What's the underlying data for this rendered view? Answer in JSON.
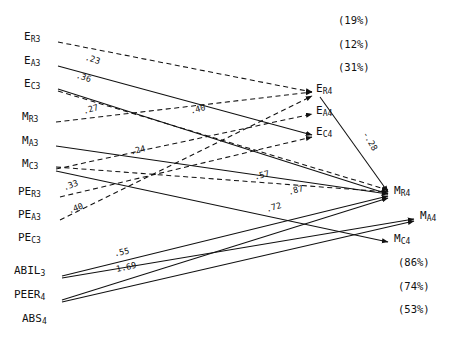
{
  "figure": {
    "type": "path-diagram",
    "background": "#ffffff",
    "ink": "#111111",
    "width": 458,
    "height": 344
  },
  "left_nodes": [
    {
      "id": "ER3",
      "base": "E",
      "sub": "R3",
      "x": 24,
      "y": 38,
      "anchor_x": 58,
      "anchor_y": 42
    },
    {
      "id": "EA3",
      "base": "E",
      "sub": "A3",
      "x": 24,
      "y": 62,
      "anchor_x": 58,
      "anchor_y": 66
    },
    {
      "id": "EC3",
      "base": "E",
      "sub": "C3",
      "x": 24,
      "y": 85,
      "anchor_x": 58,
      "anchor_y": 89
    },
    {
      "id": "MR3",
      "base": "M",
      "sub": "R3",
      "x": 22,
      "y": 118,
      "anchor_x": 56,
      "anchor_y": 122
    },
    {
      "id": "MA3",
      "base": "M",
      "sub": "A3",
      "x": 22,
      "y": 142,
      "anchor_x": 56,
      "anchor_y": 146
    },
    {
      "id": "MC3",
      "base": "M",
      "sub": "C3",
      "x": 22,
      "y": 165,
      "anchor_x": 56,
      "anchor_y": 169
    },
    {
      "id": "PER3",
      "base": "PE",
      "sub": "R3",
      "x": 18,
      "y": 193,
      "anchor_x": 60,
      "anchor_y": 197
    },
    {
      "id": "PEA3",
      "base": "PE",
      "sub": "A3",
      "x": 18,
      "y": 216,
      "anchor_x": 60,
      "anchor_y": 220
    },
    {
      "id": "PEC3",
      "base": "PE",
      "sub": "C3",
      "x": 18,
      "y": 239,
      "anchor_x": 60,
      "anchor_y": 243
    },
    {
      "id": "ABIL3",
      "base": "ABIL",
      "sub": "3",
      "x": 14,
      "y": 272,
      "anchor_x": 62,
      "anchor_y": 276
    },
    {
      "id": "PEER4",
      "base": "PEER",
      "sub": "4",
      "x": 14,
      "y": 296,
      "anchor_x": 62,
      "anchor_y": 300
    },
    {
      "id": "ABS4",
      "base": "ABS",
      "sub": "4",
      "x": 22,
      "y": 320,
      "anchor_x": 62,
      "anchor_y": 324
    }
  ],
  "right_nodes": [
    {
      "id": "ER4",
      "base": "E",
      "sub": "R4",
      "x": 316,
      "y": 90,
      "arrow_x": 314,
      "arrow_y": 94
    },
    {
      "id": "EA4",
      "base": "E",
      "sub": "A4",
      "x": 316,
      "y": 112,
      "arrow_x": 314,
      "arrow_y": 116
    },
    {
      "id": "EC4",
      "base": "E",
      "sub": "C4",
      "x": 316,
      "y": 133,
      "arrow_x": 314,
      "arrow_y": 137
    },
    {
      "id": "MR4",
      "base": "M",
      "sub": "R4",
      "x": 394,
      "y": 192,
      "arrow_x": 392,
      "arrow_y": 196
    },
    {
      "id": "MA4",
      "base": "M",
      "sub": "A4",
      "x": 420,
      "y": 217,
      "arrow_x": 418,
      "arrow_y": 221
    },
    {
      "id": "MC4",
      "base": "M",
      "sub": "C4",
      "x": 394,
      "y": 240,
      "arrow_x": 392,
      "arrow_y": 244
    }
  ],
  "variance_labels": [
    {
      "text": "(19%)",
      "x": 338,
      "y": 14
    },
    {
      "text": "(12%)",
      "x": 338,
      "y": 38
    },
    {
      "text": "(31%)",
      "x": 338,
      "y": 61
    },
    {
      "text": "(86%)",
      "x": 398,
      "y": 256
    },
    {
      "text": "(74%)",
      "x": 398,
      "y": 280
    },
    {
      "text": "(53%)",
      "x": 398,
      "y": 303
    }
  ],
  "paths": [
    {
      "id": "p-ER3-ER4",
      "from": "ER3",
      "to": "ER4",
      "style": "dashed",
      "coef": ".23",
      "coef_x": 85,
      "coef_y": 54,
      "coef_rot": 18
    },
    {
      "id": "p-EA3-EC4",
      "from": "EA3",
      "to": "EC4",
      "style": "solid",
      "coef": ".36",
      "coef_x": 76,
      "coef_y": 72,
      "coef_rot": 18
    },
    {
      "id": "p-EC3-MR4",
      "from": "EC3",
      "to": "MR4",
      "style": "solid",
      "coef": "",
      "coef_x": 0,
      "coef_y": 0,
      "coef_rot": 0
    },
    {
      "id": "p-MR3-ER4",
      "from": "MR3",
      "to": "ER4",
      "style": "dashed",
      "coef": ".27",
      "coef_x": 83,
      "coef_y": 104,
      "coef_rot": -16
    },
    {
      "id": "p-MA3-MR4",
      "from": "MA3",
      "to": "MR4",
      "style": "solid",
      "coef": "",
      "coef_x": 0,
      "coef_y": 0,
      "coef_rot": 0
    },
    {
      "id": "p-MC3-EA4",
      "from": "MC3",
      "to": "EA4",
      "style": "dashed",
      "coef": ".40",
      "coef_x": 190,
      "coef_y": 104,
      "coef_rot": -14
    },
    {
      "id": "p-MC3-MC4",
      "from": "MC3",
      "to": "MC4",
      "style": "solid",
      "coef": "",
      "coef_x": 0,
      "coef_y": 0,
      "coef_rot": 0
    },
    {
      "id": "p-PER3-EC4",
      "from": "PER3",
      "to": "EC4",
      "style": "dashed",
      "coef": ".33",
      "coef_x": 63,
      "coef_y": 180,
      "coef_rot": -20
    },
    {
      "id": "p-PEA3-ER4",
      "from": "PEA3",
      "to": "ER4",
      "style": "dashed",
      "coef": ".40",
      "coef_x": 68,
      "coef_y": 203,
      "coef_rot": -20
    },
    {
      "id": "p-PEA3-MR4",
      "from": "PEA3",
      "to": "MR4",
      "style": "dashed",
      "coef": ".24",
      "coef_x": 130,
      "coef_y": 145,
      "coef_rot": -14
    },
    {
      "id": "p-mid-MR4",
      "from": "EC3",
      "to": "MR4",
      "style": "dashed",
      "coef": ".57",
      "coef_x": 254,
      "coef_y": 170,
      "coef_rot": -14
    },
    {
      "id": "p-ABIL3-MR4",
      "from": "ABIL3",
      "to": "MR4",
      "style": "solid",
      "coef": ".87",
      "coef_x": 288,
      "coef_y": 185,
      "coef_rot": -16
    },
    {
      "id": "p-ABIL3-MA4",
      "from": "ABIL3",
      "to": "MA4",
      "style": "solid",
      "coef": ".55",
      "coef_x": 114,
      "coef_y": 247,
      "coef_rot": -12
    },
    {
      "id": "p-PEER4-MR4",
      "from": "PEER4",
      "to": "MR4",
      "style": "solid",
      "coef": ".72",
      "coef_x": 266,
      "coef_y": 202,
      "coef_rot": -16
    },
    {
      "id": "p-PEER4-MA4",
      "from": "PEER4",
      "to": "MA4",
      "style": "solid",
      "coef": "1.69",
      "coef_x": 116,
      "coef_y": 262,
      "coef_rot": -12
    },
    {
      "id": "p-ER4-MR4",
      "from": "ER4",
      "to": "MR4",
      "style": "solid",
      "coef": "-.28",
      "coef_x": 360,
      "coef_y": 136,
      "coef_rot": 60
    }
  ],
  "coefficients": [
    ".23",
    ".36",
    ".27",
    ".40",
    ".24",
    ".33",
    ".40",
    ".57",
    ".87",
    ".72",
    ".55",
    "1.69",
    "-.28"
  ]
}
